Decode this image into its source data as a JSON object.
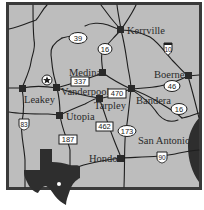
{
  "map": {
    "background_color": "#bdbdbd",
    "frame_color": "#3a3a3a",
    "water_color": "#2e2e2e",
    "towns": [
      {
        "name": "Kerrville",
        "x": 121,
        "y": 30
      },
      {
        "name": "Medina",
        "x": 103,
        "y": 73
      },
      {
        "name": "Vanderpool",
        "x": 57,
        "y": 88
      },
      {
        "name": "Leakey",
        "x": 22,
        "y": 88
      },
      {
        "name": "Boerne",
        "x": 188,
        "y": 76
      },
      {
        "name": "Bandera",
        "x": 131,
        "y": 89
      },
      {
        "name": "Tarpley",
        "x": 99,
        "y": 98
      },
      {
        "name": "Utopia",
        "x": 60,
        "y": 115
      },
      {
        "name": "Hondo",
        "x": 121,
        "y": 158
      },
      {
        "name": "San Antonio",
        "x": null,
        "y": null
      }
    ],
    "labels": {
      "kerrville": "Kerrville",
      "medina": "Medina",
      "vanderpool": "Vanderpool",
      "leakey": "Leakey",
      "boerne": "Boerne",
      "bandera": "Bandera",
      "tarpley": "Tarpley",
      "utopia": "Utopia",
      "hondo": "Hondo",
      "san_antonio": "San Antonio"
    },
    "shields": {
      "r39": "39",
      "r16_north": "16",
      "r10": "10",
      "r337": "337",
      "r46": "46",
      "r470": "470",
      "r16_south": "16",
      "r83": "83",
      "r462": "462",
      "r173": "173",
      "r187": "187",
      "r90": "90"
    },
    "marker": "star-icon",
    "inset": "texas-outline-icon"
  }
}
